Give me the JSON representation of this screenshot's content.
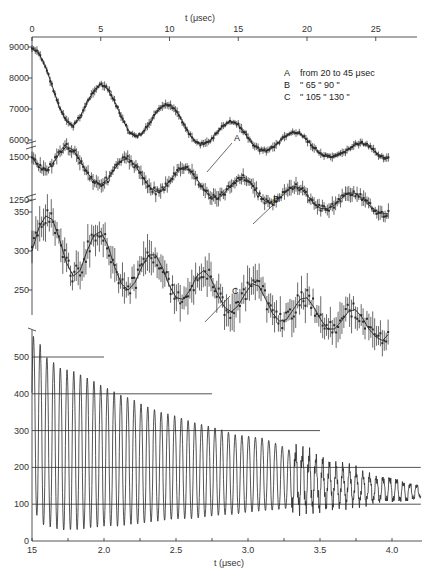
{
  "chart_data": [
    {
      "id": "upper",
      "type": "scatter",
      "title": "",
      "xlabel": "t (μsec)",
      "xaxis_position": "top",
      "xlim": [
        0,
        28
      ],
      "xticks": [
        0,
        5,
        10,
        15,
        20,
        25
      ],
      "grid": false,
      "legend": {
        "position": "top-right",
        "entries": [
          {
            "key": "A",
            "text": "from  20  to  45 μsec"
          },
          {
            "key": "B",
            "text": "\"     65  \"  90  \""
          },
          {
            "key": "C",
            "text": "\"    105  \" 130  \""
          }
        ]
      },
      "series": [
        {
          "name": "A",
          "range_text": "from 20 to 45 μsec",
          "yticks": [
            6000,
            7000,
            8000,
            9000
          ],
          "ylim": [
            5800,
            9300
          ],
          "period_us": 4.6,
          "x": [
            0,
            0.5,
            1,
            1.5,
            2,
            2.5,
            3,
            3.5,
            4,
            4.5,
            5,
            5.5,
            6,
            6.5,
            7,
            7.5,
            8,
            8.5,
            9,
            9.5,
            10,
            10.5,
            11,
            11.5,
            12,
            12.5,
            13,
            13.5,
            14,
            14.5,
            15,
            15.5,
            16,
            16.5,
            17,
            17.5,
            18,
            18.5,
            19,
            19.5,
            20,
            20.5,
            21,
            21.5,
            22,
            22.5,
            23,
            23.5,
            24,
            24.5,
            25,
            25.5,
            26
          ],
          "values": [
            8950,
            8800,
            8350,
            7700,
            7050,
            6600,
            6450,
            6750,
            7200,
            7600,
            7800,
            7650,
            7250,
            6750,
            6300,
            6100,
            6200,
            6500,
            6850,
            7100,
            7150,
            6950,
            6550,
            6150,
            5900,
            5850,
            6000,
            6250,
            6500,
            6600,
            6500,
            6200,
            5900,
            5700,
            5650,
            5750,
            5950,
            6150,
            6250,
            6200,
            6000,
            5750,
            5550,
            5450,
            5450,
            5550,
            5700,
            5850,
            5900,
            5800,
            5600,
            5450,
            5400
          ]
        },
        {
          "name": "B",
          "range_text": "from 65 to 90 μsec",
          "yticks": [
            1250,
            1500
          ],
          "ylim": [
            1200,
            1560
          ],
          "period_us": 4.6,
          "x": [
            0,
            0.5,
            1,
            1.5,
            2,
            2.5,
            3,
            3.5,
            4,
            4.5,
            5,
            5.5,
            6,
            6.5,
            7,
            7.5,
            8,
            8.5,
            9,
            9.5,
            10,
            10.5,
            11,
            11.5,
            12,
            12.5,
            13,
            13.5,
            14,
            14.5,
            15,
            15.5,
            16,
            16.5,
            17,
            17.5,
            18,
            18.5,
            19,
            19.5,
            20,
            20.5,
            21,
            21.5,
            22,
            22.5,
            23,
            23.5,
            24,
            24.5,
            25,
            25.5,
            26
          ],
          "values": [
            1500,
            1440,
            1420,
            1460,
            1520,
            1560,
            1540,
            1480,
            1410,
            1360,
            1340,
            1370,
            1430,
            1480,
            1490,
            1450,
            1390,
            1330,
            1300,
            1310,
            1360,
            1410,
            1440,
            1420,
            1370,
            1310,
            1270,
            1260,
            1290,
            1340,
            1380,
            1380,
            1340,
            1280,
            1240,
            1230,
            1260,
            1300,
            1330,
            1320,
            1280,
            1230,
            1200,
            1200,
            1220,
            1260,
            1290,
            1290,
            1260,
            1220,
            1190,
            1170,
            1170
          ]
        },
        {
          "name": "C",
          "range_text": "from 105 to 130 μsec",
          "yticks": [
            250,
            300,
            350
          ],
          "ylim": [
            225,
            365
          ],
          "period_us": 4.6,
          "x": [
            0,
            0.5,
            1,
            1.5,
            2,
            2.5,
            3,
            3.5,
            4,
            4.5,
            5,
            5.5,
            6,
            6.5,
            7,
            7.5,
            8,
            8.5,
            9,
            9.5,
            10,
            10.5,
            11,
            11.5,
            12,
            12.5,
            13,
            13.5,
            14,
            14.5,
            15,
            15.5,
            16,
            16.5,
            17,
            17.5,
            18,
            18.5,
            19,
            19.5,
            20,
            20.5,
            21,
            21.5,
            22,
            22.5,
            23,
            23.5,
            24,
            24.5,
            25,
            25.5,
            26
          ],
          "values": [
            300,
            330,
            345,
            340,
            315,
            285,
            268,
            275,
            300,
            320,
            325,
            308,
            280,
            258,
            250,
            260,
            280,
            295,
            295,
            278,
            255,
            240,
            238,
            250,
            268,
            275,
            265,
            245,
            228,
            222,
            230,
            245,
            258,
            255,
            238,
            220,
            210,
            212,
            225,
            238,
            240,
            228,
            212,
            200,
            200,
            210,
            222,
            225,
            215,
            200,
            190,
            185,
            195
          ]
        }
      ],
      "series_labels": [
        {
          "text": "A",
          "x_us": 12.8,
          "pointer": true
        },
        {
          "text": "B",
          "x_us": 14.8,
          "pointer": true
        },
        {
          "text": "C",
          "x_us": 11.8,
          "pointer": true
        }
      ],
      "error_bars": true,
      "fit_curve": "damped sinusoid"
    },
    {
      "id": "lower",
      "type": "line",
      "title": "",
      "xlabel": "t (μsec)",
      "ylabel": "",
      "xlim": [
        1.5,
        4.2
      ],
      "ylim": [
        0,
        570
      ],
      "xticks": [
        1.5,
        2.0,
        2.5,
        3.0,
        3.5,
        4.0
      ],
      "xtick_labels": [
        "15",
        "2.0",
        "2.5",
        "3.0",
        "3.5",
        "4.0"
      ],
      "yticks": [
        0,
        100,
        200,
        300,
        400,
        500
      ],
      "grid": false,
      "reference_lines": [
        {
          "y": 500,
          "x_end": 2.0
        },
        {
          "y": 400,
          "x_end": 2.75
        },
        {
          "y": 300,
          "x_end": 3.5
        },
        {
          "y": 200,
          "x_end": 4.2
        },
        {
          "y": 100,
          "x_end": 4.2
        }
      ],
      "oscillation_period_us": 0.0467,
      "envelope": {
        "x": [
          1.5,
          1.55,
          1.6,
          1.7,
          1.8,
          1.9,
          2.0,
          2.1,
          2.2,
          2.3,
          2.4,
          2.5,
          2.6,
          2.7,
          2.8,
          2.9,
          3.0,
          3.1,
          3.2,
          3.3,
          3.4,
          3.5,
          3.6,
          3.7,
          3.8,
          3.9,
          4.0,
          4.1,
          4.2
        ],
        "max": [
          560,
          540,
          500,
          470,
          460,
          440,
          420,
          400,
          385,
          365,
          350,
          340,
          325,
          315,
          305,
          290,
          285,
          280,
          265,
          245,
          235,
          215,
          200,
          195,
          180,
          170,
          170,
          155,
          150
        ],
        "min": [
          110,
          50,
          40,
          30,
          30,
          35,
          40,
          40,
          45,
          50,
          55,
          60,
          60,
          65,
          70,
          72,
          78,
          82,
          85,
          90,
          95,
          95,
          100,
          105,
          105,
          110,
          110,
          110,
          120
        ]
      }
    }
  ]
}
